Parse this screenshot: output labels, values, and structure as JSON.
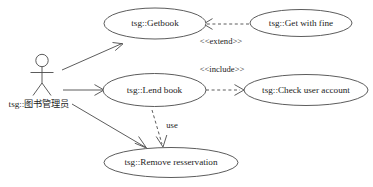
{
  "diagram": {
    "type": "uml-use-case-diagram",
    "background_color": "#ffffff",
    "line_color": "#4a4a4a",
    "text_color": "#1c1c1c",
    "actor": {
      "name": "librarian-actor",
      "label": "tsg::图书管理员"
    },
    "use_cases": [
      {
        "id": "getbook",
        "label": "tsg::Getbook"
      },
      {
        "id": "get_with_fine",
        "label": "tsg::Get with fine"
      },
      {
        "id": "lend_book",
        "label": "tsg::Lend book"
      },
      {
        "id": "check_user_account",
        "label": "tsg::Check user account"
      },
      {
        "id": "remove_reservation",
        "label": "tsg::Remove resservation"
      }
    ],
    "relationships": [
      {
        "id": "extend",
        "label": "<<extend>>",
        "style": "dashed",
        "from": "get_with_fine",
        "to": "getbook"
      },
      {
        "id": "include",
        "label": "<<include>>",
        "style": "dashed",
        "from": "lend_book",
        "to": "check_user_account"
      },
      {
        "id": "use",
        "label": "use",
        "style": "dashed",
        "from": "lend_book",
        "to": "remove_reservation"
      },
      {
        "id": "assoc-getbook",
        "label": "",
        "style": "solid",
        "from": "librarian-actor",
        "to": "getbook"
      },
      {
        "id": "assoc-lend",
        "label": "",
        "style": "solid",
        "from": "librarian-actor",
        "to": "lend_book"
      },
      {
        "id": "assoc-remove",
        "label": "",
        "style": "solid",
        "from": "librarian-actor",
        "to": "remove_reservation"
      }
    ]
  }
}
